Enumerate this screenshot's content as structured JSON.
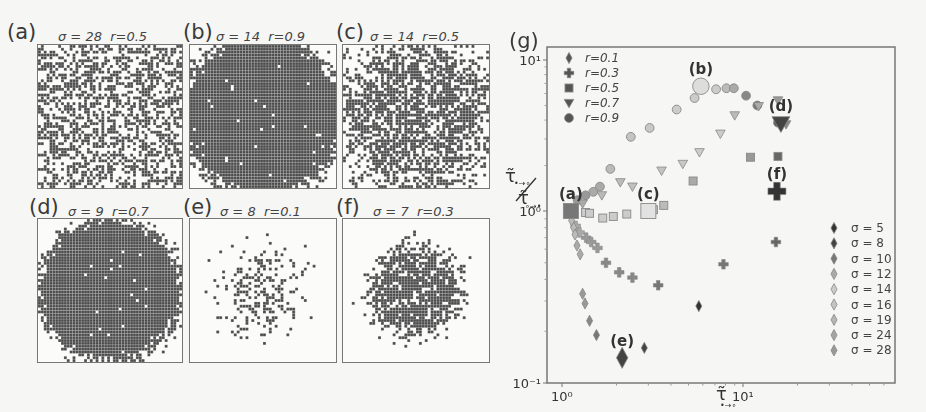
{
  "panels": [
    {
      "id": "a",
      "label": "(a)",
      "sigma_text": "σ = 28",
      "r_text": "r=0.5",
      "sigma": 28,
      "r": 0.5,
      "density": "mixed",
      "fill": 0.5,
      "spread": 999,
      "seed": 11
    },
    {
      "id": "b",
      "label": "(b)",
      "sigma_text": "σ = 14",
      "r_text": "r=0.9",
      "sigma": 14,
      "r": 0.9,
      "density": "dense",
      "fill": 0.9,
      "spread": 1.25,
      "seed": 22
    },
    {
      "id": "c",
      "label": "(c)",
      "sigma_text": "σ = 14",
      "r_text": "r=0.5",
      "sigma": 14,
      "r": 0.5,
      "density": "medium",
      "fill": 0.5,
      "spread": 1.05,
      "seed": 33
    },
    {
      "id": "d",
      "label": "(d)",
      "sigma_text": "σ = 9",
      "r_text": "r=0.7",
      "sigma": 9,
      "r": 0.7,
      "density": "dense",
      "fill": 0.7,
      "spread": 1.12,
      "seed": 44
    },
    {
      "id": "e",
      "label": "(e)",
      "sigma_text": "σ = 8",
      "r_text": "r=0.1",
      "sigma": 8,
      "r": 0.1,
      "density": "sparse",
      "fill": 0.1,
      "spread": 0.62,
      "seed": 55
    },
    {
      "id": "f",
      "label": "(f)",
      "sigma_text": "σ = 7",
      "r_text": "r=0.3",
      "sigma": 7,
      "r": 0.3,
      "density": "medium",
      "fill": 0.3,
      "spread": 0.68,
      "seed": 66
    }
  ],
  "chart_data": {
    "type": "scatter",
    "panel_label": "(g)",
    "title": "",
    "xlabel": "τ̃ •→∘",
    "ylabel": "τ̃ •→∘ / τ̃ ∘→•",
    "xscale": "log",
    "yscale": "log",
    "xlim": [
      0.85,
      70
    ],
    "ylim": [
      0.1,
      12
    ],
    "x_ticks": [
      {
        "value": 1,
        "label": "10⁰"
      },
      {
        "value": 10,
        "label": "10¹"
      }
    ],
    "y_ticks": [
      {
        "value": 0.1,
        "label": "10⁻¹"
      },
      {
        "value": 1,
        "label": "10⁰"
      },
      {
        "value": 10,
        "label": "10¹"
      }
    ],
    "grid": false,
    "legend_r": {
      "position": "upper left",
      "entries": [
        {
          "label": "r=0.1",
          "marker": "thin-diamond"
        },
        {
          "label": "r=0.3",
          "marker": "plus"
        },
        {
          "label": "r=0.5",
          "marker": "square"
        },
        {
          "label": "r=0.7",
          "marker": "triangle-down"
        },
        {
          "label": "r=0.9",
          "marker": "circle"
        }
      ]
    },
    "legend_sigma": {
      "position": "lower right",
      "entries": [
        {
          "label": "σ = 5",
          "color": "#333333"
        },
        {
          "label": "σ = 8",
          "color": "#444444"
        },
        {
          "label": "σ = 10",
          "color": "#777777"
        },
        {
          "label": "σ = 12",
          "color": "#aaaaaa"
        },
        {
          "label": "σ = 14",
          "color": "#cccccc"
        },
        {
          "label": "σ = 16",
          "color": "#c4c4c4"
        },
        {
          "label": "σ = 19",
          "color": "#b6b6b6"
        },
        {
          "label": "σ = 24",
          "color": "#a4a4a4"
        },
        {
          "label": "σ = 28",
          "color": "#999999"
        }
      ]
    },
    "series": [
      {
        "name": "r=0.9",
        "marker": "circle",
        "points": [
          {
            "x": 1.22,
            "y": 1.18,
            "color": "#999"
          },
          {
            "x": 1.35,
            "y": 1.27,
            "color": "#999"
          },
          {
            "x": 1.49,
            "y": 1.34,
            "color": "#aaa"
          },
          {
            "x": 1.62,
            "y": 1.45,
            "color": "#aaa"
          },
          {
            "x": 1.85,
            "y": 1.9,
            "color": "#bbb"
          },
          {
            "x": 2.4,
            "y": 3.1,
            "color": "#c4c4c4"
          },
          {
            "x": 3.05,
            "y": 3.55,
            "color": "#c8c8c8"
          },
          {
            "x": 4.3,
            "y": 4.7,
            "color": "#ccc"
          },
          {
            "x": 5.4,
            "y": 5.6,
            "color": "#ccc"
          },
          {
            "x": 7.1,
            "y": 6.4,
            "color": "#ccc"
          },
          {
            "x": 8.1,
            "y": 6.5,
            "color": "#bbb"
          },
          {
            "x": 8.9,
            "y": 6.5,
            "color": "#aaa"
          },
          {
            "x": 10.4,
            "y": 5.8,
            "color": "#888"
          },
          {
            "x": 12.0,
            "y": 5.0,
            "color": "#777"
          },
          {
            "x": 15.6,
            "y": 3.85,
            "color": "#555"
          }
        ]
      },
      {
        "name": "r=0.7",
        "marker": "triangle-down",
        "points": [
          {
            "x": 1.3,
            "y": 1.12,
            "color": "#aaa"
          },
          {
            "x": 1.66,
            "y": 1.27,
            "color": "#bbb"
          },
          {
            "x": 2.1,
            "y": 1.55,
            "color": "#bbb"
          },
          {
            "x": 2.45,
            "y": 1.45,
            "color": "#c0c0c0"
          },
          {
            "x": 3.55,
            "y": 1.85,
            "color": "#c4c4c4"
          },
          {
            "x": 4.65,
            "y": 2.05,
            "color": "#c8c8c8"
          },
          {
            "x": 5.75,
            "y": 2.45,
            "color": "#ccc"
          },
          {
            "x": 7.5,
            "y": 3.25,
            "color": "#ccc"
          },
          {
            "x": 9.0,
            "y": 4.3,
            "color": "#bbb"
          },
          {
            "x": 12.2,
            "y": 4.95,
            "color": "#aaa"
          },
          {
            "x": 15.6,
            "y": 5.4,
            "color": "#999"
          },
          {
            "x": 17.3,
            "y": 3.75,
            "color": "#888"
          }
        ]
      },
      {
        "name": "r=0.5",
        "marker": "square",
        "points": [
          {
            "x": 1.35,
            "y": 0.98,
            "color": "#ccc"
          },
          {
            "x": 1.42,
            "y": 0.97,
            "color": "#ccc"
          },
          {
            "x": 1.68,
            "y": 0.91,
            "color": "#ccc"
          },
          {
            "x": 1.92,
            "y": 0.93,
            "color": "#ccc"
          },
          {
            "x": 2.28,
            "y": 0.96,
            "color": "#ccc"
          },
          {
            "x": 3.2,
            "y": 1.02,
            "color": "#c4c4c4"
          },
          {
            "x": 3.65,
            "y": 1.09,
            "color": "#bbb"
          },
          {
            "x": 5.3,
            "y": 1.58,
            "color": "#aaa"
          },
          {
            "x": 11.0,
            "y": 2.27,
            "color": "#999"
          },
          {
            "x": 15.6,
            "y": 2.3,
            "color": "#666"
          }
        ]
      },
      {
        "name": "r=0.3",
        "marker": "plus",
        "points": [
          {
            "x": 1.19,
            "y": 0.82,
            "color": "#aaa"
          },
          {
            "x": 1.25,
            "y": 0.75,
            "color": "#aaa"
          },
          {
            "x": 1.36,
            "y": 0.7,
            "color": "#999"
          },
          {
            "x": 1.45,
            "y": 0.66,
            "color": "#999"
          },
          {
            "x": 1.57,
            "y": 0.61,
            "color": "#999"
          },
          {
            "x": 1.75,
            "y": 0.5,
            "color": "#888"
          },
          {
            "x": 2.07,
            "y": 0.44,
            "color": "#888"
          },
          {
            "x": 2.45,
            "y": 0.41,
            "color": "#888"
          },
          {
            "x": 3.4,
            "y": 0.37,
            "color": "#777"
          },
          {
            "x": 7.8,
            "y": 0.49,
            "color": "#777"
          },
          {
            "x": 15.2,
            "y": 0.66,
            "color": "#666"
          }
        ]
      },
      {
        "name": "r=0.1",
        "marker": "thin-diamond",
        "points": [
          {
            "x": 1.13,
            "y": 0.88,
            "color": "#bbb"
          },
          {
            "x": 1.16,
            "y": 0.8,
            "color": "#bbb"
          },
          {
            "x": 1.18,
            "y": 0.73,
            "color": "#bbb"
          },
          {
            "x": 1.21,
            "y": 0.63,
            "color": "#aaa"
          },
          {
            "x": 1.26,
            "y": 0.56,
            "color": "#aaa"
          },
          {
            "x": 1.3,
            "y": 0.33,
            "color": "#999"
          },
          {
            "x": 1.34,
            "y": 0.29,
            "color": "#999"
          },
          {
            "x": 1.42,
            "y": 0.23,
            "color": "#888"
          },
          {
            "x": 1.55,
            "y": 0.19,
            "color": "#777"
          },
          {
            "x": 2.85,
            "y": 0.16,
            "color": "#444"
          },
          {
            "x": 5.7,
            "y": 0.28,
            "color": "#333"
          }
        ]
      }
    ],
    "highlighted": [
      {
        "label": "(a)",
        "x": 1.12,
        "y": 1.0,
        "marker": "square",
        "color": "#777"
      },
      {
        "label": "(b)",
        "x": 5.85,
        "y": 6.7,
        "marker": "circle",
        "color": "#ddd"
      },
      {
        "label": "(c)",
        "x": 3.0,
        "y": 1.0,
        "marker": "square",
        "color": "#e2e2e2"
      },
      {
        "label": "(d)",
        "x": 16.2,
        "y": 3.8,
        "marker": "triangle-down",
        "color": "#444"
      },
      {
        "label": "(e)",
        "x": 2.15,
        "y": 0.14,
        "marker": "thin-diamond",
        "color": "#444"
      },
      {
        "label": "(f)",
        "x": 15.4,
        "y": 1.35,
        "marker": "plus",
        "color": "#333"
      }
    ]
  }
}
